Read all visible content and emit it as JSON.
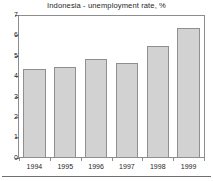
{
  "chart_data": {
    "type": "bar",
    "title": "Indonesia - unemployment rate, %",
    "subtitle": "",
    "xlabel": "",
    "ylabel": "",
    "categories": [
      "1994",
      "1995",
      "1996",
      "1997",
      "1998",
      "1999"
    ],
    "values": [
      4.4,
      4.5,
      4.9,
      4.7,
      5.5,
      6.4
    ],
    "series": [
      {
        "name": "unemployment rate",
        "values": [
          4.4,
          4.5,
          4.9,
          4.7,
          5.5,
          6.4
        ]
      }
    ],
    "ylim": [
      0,
      7
    ],
    "xlim": [
      0,
      6
    ],
    "ytick_labels": [
      "0",
      "1",
      "2",
      "3",
      "4",
      "5",
      "6",
      "7"
    ],
    "ytick_values": [
      0,
      1,
      2,
      3,
      4,
      5,
      6,
      7
    ],
    "grid": false,
    "legend": false,
    "legend_position": "none",
    "bar_fill_color": "#d2d2d2",
    "bar_edge_color": "#8f8f8f",
    "frame_color": "#8d8d8d",
    "background_color": "#ffffff",
    "text_color": "#1f1f1f"
  },
  "axes": {
    "y": {
      "ticks": [
        {
          "label": "7",
          "value": 7
        },
        {
          "label": "6",
          "value": 6
        },
        {
          "label": "5",
          "value": 5
        },
        {
          "label": "4",
          "value": 4
        },
        {
          "label": "3",
          "value": 3
        },
        {
          "label": "2",
          "value": 2
        },
        {
          "label": "1",
          "value": 1
        },
        {
          "label": "0",
          "value": 0
        }
      ]
    },
    "x": {
      "ticks": [
        {
          "label": "1994"
        },
        {
          "label": "1995"
        },
        {
          "label": "1996"
        },
        {
          "label": "1997"
        },
        {
          "label": "1998"
        },
        {
          "label": "1999"
        }
      ]
    }
  }
}
